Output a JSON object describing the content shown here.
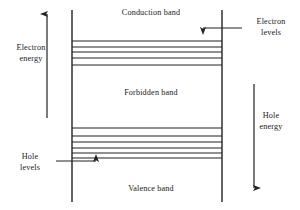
{
  "diagram": {
    "background_color": "#ffffff",
    "line_color": "#222222",
    "text_color": "#1a1a1a",
    "bands": {
      "conduction": {
        "label": "Conduction band"
      },
      "forbidden": {
        "label": "Forbidden band"
      },
      "valence": {
        "label": "Valence band"
      }
    },
    "axes": {
      "electron_energy": {
        "label_line1": "Electron",
        "label_line2": "energy",
        "direction": "up",
        "arrow_x": 47,
        "arrow_top_y": 14,
        "arrow_bottom_y": 118
      },
      "hole_energy": {
        "label_line1": "Hole",
        "label_line2": "energy",
        "direction": "down",
        "arrow_x": 254,
        "arrow_top_y": 84,
        "arrow_bottom_y": 188
      }
    },
    "callouts": {
      "electron_levels": {
        "label_line1": "Electron",
        "label_line2": "levels",
        "arrow_direction": "left",
        "arrow_from_x": 242,
        "arrow_to_x": 203,
        "arrow_y": 28
      },
      "hole_levels": {
        "label_line1": "Hole",
        "label_line2": "levels",
        "arrow_direction": "right",
        "arrow_from_x": 56,
        "arrow_to_x": 96,
        "arrow_y": 161
      }
    },
    "frame": {
      "left_x": 72,
      "right_x": 222,
      "top_y": 10,
      "bottom_y": 202
    },
    "electron_levels_lines_y": [
      41,
      47,
      52,
      58,
      65
    ],
    "hole_levels_lines_y": [
      128,
      136,
      142,
      148,
      153,
      158
    ]
  }
}
